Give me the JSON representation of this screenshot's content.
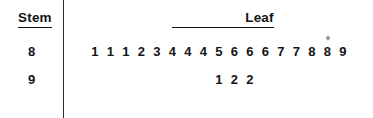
{
  "headers": {
    "stem": "Stem",
    "leaf": "Leaf"
  },
  "chart_data": {
    "type": "table",
    "title": "",
    "subtitle": "",
    "plot_kind": "stem-and-leaf",
    "xlabel": "",
    "ylabel": "",
    "grid": false,
    "legend": null,
    "columns": [
      "Stem",
      "Leaf"
    ],
    "rows": [
      {
        "stem": "8",
        "leaves": [
          "1",
          "1",
          "1",
          "2",
          "3",
          "4",
          "4",
          "4",
          "5",
          "6",
          "6",
          "6",
          "7",
          "7",
          "8",
          "8",
          "9"
        ],
        "leaf_count": 17,
        "values": [
          81,
          81,
          81,
          82,
          83,
          84,
          84,
          84,
          85,
          86,
          86,
          86,
          87,
          87,
          88,
          88,
          89
        ]
      },
      {
        "stem": "9",
        "leaves": [
          "1",
          "2",
          "2"
        ],
        "leaf_count": 3,
        "values": [
          91,
          92,
          92
        ]
      }
    ],
    "total_count": 20,
    "min": 81,
    "max": 92,
    "annotations": []
  },
  "style": {
    "ink": "#141414",
    "rule": "#2b2b2b",
    "background": "#ffffff"
  }
}
